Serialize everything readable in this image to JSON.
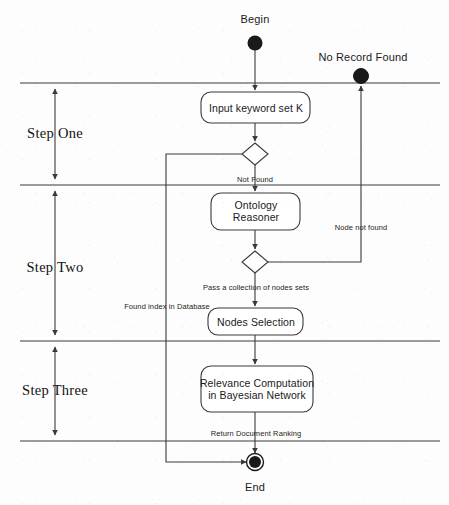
{
  "diagram": {
    "type": "uml-activity-diagram",
    "background_color": "#fdfdfd",
    "line_color": "#3a3a3a",
    "text_color": "#1a1a1a",
    "width": 449,
    "height": 505,
    "nodes": {
      "begin": {
        "label": "Begin",
        "kind": "initial-node",
        "x": 255,
        "y": 43,
        "label_x": 255,
        "label_y": 19
      },
      "no_record_found": {
        "label": "No Record Found",
        "kind": "final-node",
        "x": 361,
        "y": 76,
        "label_x": 363,
        "label_y": 57
      },
      "end": {
        "label": "End",
        "kind": "final-node",
        "x": 255,
        "y": 462,
        "label_x": 255,
        "label_y": 487
      }
    },
    "activities": [
      {
        "id": "input-keyword-set",
        "label": "Input keyword set K",
        "lines": [
          "Input keyword set K"
        ],
        "x": 201,
        "y": 92,
        "w": 109,
        "h": 31
      },
      {
        "id": "ontology-reasoner",
        "label": "Ontology Reasoner",
        "lines": [
          "Ontology",
          "Reasoner"
        ],
        "x": 211,
        "y": 193,
        "w": 89,
        "h": 37
      },
      {
        "id": "nodes-selection",
        "label": "Nodes Selection",
        "lines": [
          "Nodes Selection"
        ],
        "x": 208,
        "y": 308,
        "w": 95,
        "h": 27
      },
      {
        "id": "relevance-computation",
        "label": "Relevance Computation in Bayesian Network",
        "lines": [
          "Relevance Computation",
          "in Bayesian Network"
        ],
        "x": 201,
        "y": 366,
        "w": 112,
        "h": 46
      }
    ],
    "decisions": [
      {
        "id": "decision-record-found",
        "x": 255,
        "y": 154,
        "rx": 13,
        "ry": 11
      },
      {
        "id": "decision-node-found",
        "x": 255,
        "y": 262,
        "rx": 13,
        "ry": 11
      }
    ],
    "edge_labels": [
      {
        "id": "not-found",
        "text": "Not Found",
        "x": 255,
        "y": 180
      },
      {
        "id": "node-not-found",
        "text": "Node not found",
        "x": 361,
        "y": 228
      },
      {
        "id": "pass-collection",
        "text": "Pass a collection of nodes sets",
        "x": 256,
        "y": 288
      },
      {
        "id": "found-index",
        "text": "Found index in Database",
        "x": 167,
        "y": 307
      },
      {
        "id": "return-ranking",
        "text": "Return Document Ranking",
        "x": 256,
        "y": 434
      }
    ],
    "swimlane_separators": [
      {
        "id": "separator-top",
        "y": 83,
        "x1": 20,
        "x2": 440
      },
      {
        "id": "separator-one-two",
        "y": 185,
        "x1": 20,
        "x2": 440
      },
      {
        "id": "separator-two-three",
        "y": 341,
        "x1": 20,
        "x2": 440
      },
      {
        "id": "separator-bottom",
        "y": 441,
        "x1": 20,
        "x2": 440
      }
    ],
    "steps": [
      {
        "id": "step-one",
        "label": "Step One",
        "x": 55,
        "y": 134,
        "top": 83,
        "bottom": 185
      },
      {
        "id": "step-two",
        "label": "Step Two",
        "x": 55,
        "y": 268,
        "top": 185,
        "bottom": 341
      },
      {
        "id": "step-three",
        "label": "Step Three",
        "x": 55,
        "y": 391,
        "top": 341,
        "bottom": 441
      }
    ]
  }
}
